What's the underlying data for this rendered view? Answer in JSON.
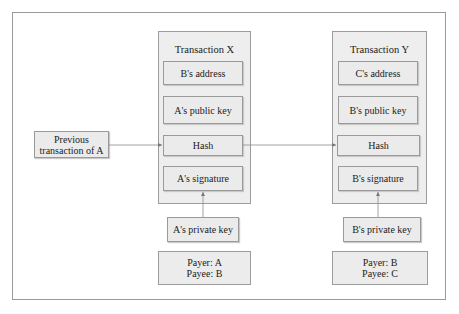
{
  "previous": {
    "line1": "Previous",
    "line2": "transaction of A"
  },
  "tx_x": {
    "title": "Transaction X",
    "address": "B's address",
    "public_key": "A's public key",
    "hash": "Hash",
    "signature": "A's signature",
    "private_key": "A's private key",
    "payer": "Payer: A",
    "payee": "Payee: B"
  },
  "tx_y": {
    "title": "Transaction Y",
    "address": "C's address",
    "public_key": "B's public key",
    "hash": "Hash",
    "signature": "B's signature",
    "private_key": "B's private key",
    "payer": "Payer: B",
    "payee": "Payee: C"
  },
  "colors": {
    "box_fill": "#ebebeb",
    "container_fill": "#eeeeee",
    "border": "#9a9a9a",
    "arrow": "#777777"
  }
}
